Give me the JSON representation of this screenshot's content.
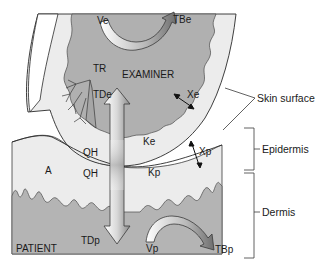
{
  "diagram": {
    "colors": {
      "background": "#ffffff",
      "skin_light": "#ececec",
      "dermis_gray": "#b4b4b4",
      "examiner_gray": "#b0b0b0",
      "outline": "#2a2a2a",
      "arrow_light": "#f4f4f4",
      "arrow_dark": "#7a7a7a"
    },
    "labels": {
      "ve": "Ve",
      "tbe": "TBe",
      "tr": "TR",
      "examiner": "EXAMINER",
      "tde": "TDe",
      "xe": "Xe",
      "ke": "Ke",
      "qh_top": "QH",
      "qh_bottom": "QH",
      "a": "A",
      "kp": "Kp",
      "xp": "Xp",
      "tdp": "TDp",
      "vp": "Vp",
      "tbp": "TBp",
      "patient": "PATIENT"
    },
    "side_labels": {
      "skin_surface": "Skin surface",
      "epidermis": "Epidermis",
      "dermis": "Dermis"
    }
  }
}
